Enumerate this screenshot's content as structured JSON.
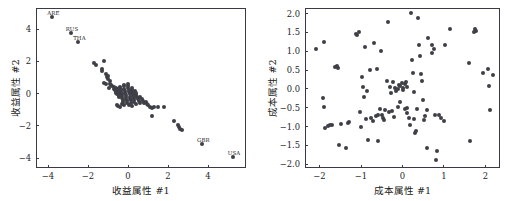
{
  "figure": {
    "background_color": "#ffffff",
    "marker_color": "#3f3f47",
    "axis_color": "#3a3a46",
    "panel_count": 2
  },
  "chart_data": [
    {
      "type": "scatter",
      "title": "",
      "xlabel": "收益属性 #1",
      "ylabel": "收益属性 #2",
      "xlim": [
        -4.6,
        5.9
      ],
      "ylim": [
        -4.6,
        5.3
      ],
      "xticks": [
        -4,
        -2,
        0,
        2,
        4
      ],
      "xticklabels": [
        "−4",
        "−2",
        "0",
        "2",
        "4"
      ],
      "yticks": [
        -4,
        -2,
        0,
        2,
        4
      ],
      "yticklabels": [
        "−4",
        "−2",
        "0",
        "2",
        "4"
      ],
      "grid": false,
      "legend": null,
      "marker_color": "#3f3f47",
      "annotations": [
        {
          "text": "ARE",
          "x": -3.78,
          "y": 4.72
        },
        {
          "text": "RUS",
          "x": -2.85,
          "y": 3.78
        },
        {
          "text": "THA",
          "x": -2.48,
          "y": 3.22
        },
        {
          "text": "GBR",
          "x": 3.72,
          "y": -3.14
        },
        {
          "text": "USA",
          "x": 5.25,
          "y": -3.92
        }
      ],
      "points": [
        [
          -3.78,
          4.72
        ],
        [
          -2.85,
          3.78
        ],
        [
          -2.48,
          3.22
        ],
        [
          -1.72,
          1.88
        ],
        [
          -1.62,
          1.8
        ],
        [
          -1.3,
          1.55
        ],
        [
          -1.28,
          1.38
        ],
        [
          -1.22,
          2.02
        ],
        [
          -1.1,
          1.22
        ],
        [
          -1.05,
          1.05
        ],
        [
          -1.0,
          0.92
        ],
        [
          -0.98,
          1.1
        ],
        [
          -0.92,
          0.78
        ],
        [
          -0.88,
          0.62
        ],
        [
          -0.85,
          0.55
        ],
        [
          -0.78,
          0.48
        ],
        [
          -0.72,
          0.42
        ],
        [
          -0.68,
          0.3
        ],
        [
          -0.65,
          0.22
        ],
        [
          -0.62,
          0.12
        ],
        [
          -0.6,
          0.38
        ],
        [
          -0.58,
          0.05
        ],
        [
          -0.55,
          -0.05
        ],
        [
          -0.52,
          0.18
        ],
        [
          -0.5,
          0.28
        ],
        [
          -0.48,
          0.08
        ],
        [
          -0.46,
          -0.12
        ],
        [
          -0.44,
          -0.22
        ],
        [
          -0.42,
          0.0
        ],
        [
          -0.4,
          0.42
        ],
        [
          -0.38,
          0.35
        ],
        [
          -0.36,
          0.2
        ],
        [
          -0.34,
          0.1
        ],
        [
          -0.32,
          -0.02
        ],
        [
          -0.3,
          -0.15
        ],
        [
          -0.28,
          -0.28
        ],
        [
          -0.26,
          -0.4
        ],
        [
          -0.24,
          -0.5
        ],
        [
          -0.22,
          0.52
        ],
        [
          -0.2,
          0.45
        ],
        [
          -0.18,
          0.3
        ],
        [
          -0.16,
          0.18
        ],
        [
          -0.14,
          0.05
        ],
        [
          -0.12,
          -0.08
        ],
        [
          -0.1,
          -0.2
        ],
        [
          -0.08,
          -0.32
        ],
        [
          -0.06,
          -0.45
        ],
        [
          -0.04,
          -0.58
        ],
        [
          -0.02,
          0.6
        ],
        [
          0.0,
          0.48
        ],
        [
          0.02,
          0.32
        ],
        [
          0.04,
          0.2
        ],
        [
          0.06,
          0.08
        ],
        [
          0.08,
          -0.05
        ],
        [
          0.1,
          -0.18
        ],
        [
          0.12,
          -0.3
        ],
        [
          0.14,
          -0.42
        ],
        [
          0.16,
          -0.55
        ],
        [
          0.18,
          0.38
        ],
        [
          0.2,
          0.25
        ],
        [
          0.22,
          0.12
        ],
        [
          0.24,
          -0.02
        ],
        [
          0.26,
          -0.14
        ],
        [
          0.28,
          -0.26
        ],
        [
          0.3,
          -0.38
        ],
        [
          0.32,
          -0.5
        ],
        [
          0.34,
          0.18
        ],
        [
          0.38,
          0.05
        ],
        [
          0.42,
          -0.08
        ],
        [
          0.46,
          -0.2
        ],
        [
          0.5,
          -0.32
        ],
        [
          0.54,
          -0.44
        ],
        [
          0.58,
          -0.56
        ],
        [
          0.62,
          -0.2
        ],
        [
          0.68,
          -0.34
        ],
        [
          0.74,
          -0.48
        ],
        [
          0.8,
          -0.6
        ],
        [
          0.88,
          -0.52
        ],
        [
          0.96,
          -0.66
        ],
        [
          1.02,
          -0.72
        ],
        [
          1.1,
          -0.85
        ],
        [
          1.18,
          -0.88
        ],
        [
          1.22,
          -1.38
        ],
        [
          1.3,
          -0.82
        ],
        [
          1.48,
          -0.8
        ],
        [
          1.8,
          -0.82
        ],
        [
          2.32,
          -1.72
        ],
        [
          2.48,
          -1.95
        ],
        [
          2.55,
          -2.05
        ],
        [
          2.62,
          -2.18
        ],
        [
          2.7,
          -2.22
        ],
        [
          -0.55,
          -0.68
        ],
        [
          -0.48,
          -0.75
        ],
        [
          -0.42,
          -0.82
        ],
        [
          -0.3,
          -0.62
        ],
        [
          -0.22,
          -0.7
        ],
        [
          0.05,
          -0.72
        ],
        [
          0.18,
          -0.78
        ],
        [
          0.4,
          -0.65
        ],
        [
          -1.18,
          0.68
        ],
        [
          -1.12,
          0.6
        ],
        [
          -0.95,
          0.38
        ],
        [
          3.72,
          -3.14
        ],
        [
          5.25,
          -3.92
        ]
      ]
    },
    {
      "type": "scatter",
      "title": "",
      "xlabel": "成本属性 #1",
      "ylabel": "成本属性 #2",
      "xlim": [
        -2.35,
        2.35
      ],
      "ylim": [
        -2.1,
        2.15
      ],
      "xticks": [
        -2,
        -1,
        0,
        1,
        2
      ],
      "xticklabels": [
        "−2",
        "−1",
        "0",
        "1",
        "2"
      ],
      "yticks": [
        -2.0,
        -1.5,
        -1.0,
        -0.5,
        0.0,
        0.5,
        1.0,
        1.5,
        2.0
      ],
      "yticklabels": [
        "−2.0",
        "−1.5",
        "−1.0",
        "−0.5",
        "0.0",
        "0.5",
        "1.0",
        "1.5",
        "2.0"
      ],
      "grid": false,
      "legend": null,
      "marker_color": "#3f3f47",
      "annotations": [],
      "points": [
        [
          -2.08,
          1.05
        ],
        [
          -1.9,
          1.25
        ],
        [
          -1.92,
          -0.25
        ],
        [
          -1.9,
          -0.48
        ],
        [
          -1.88,
          -1.05
        ],
        [
          -1.8,
          -0.98
        ],
        [
          -1.74,
          -0.95
        ],
        [
          -1.7,
          -0.95
        ],
        [
          -1.62,
          0.58
        ],
        [
          -1.58,
          0.62
        ],
        [
          -1.55,
          0.55
        ],
        [
          -1.52,
          -1.5
        ],
        [
          -1.48,
          -0.92
        ],
        [
          -1.35,
          -1.58
        ],
        [
          -1.32,
          -0.9
        ],
        [
          -1.28,
          -0.88
        ],
        [
          -1.12,
          1.45
        ],
        [
          -1.1,
          1.42
        ],
        [
          -1.05,
          1.5
        ],
        [
          -1.02,
          -0.6
        ],
        [
          -1.0,
          -1.02
        ],
        [
          -0.98,
          0.32
        ],
        [
          -0.95,
          0.05
        ],
        [
          -0.92,
          -0.22
        ],
        [
          -0.9,
          1.12
        ],
        [
          -0.88,
          -0.8
        ],
        [
          -0.85,
          -0.05
        ],
        [
          -0.82,
          -1.35
        ],
        [
          -0.78,
          0.5
        ],
        [
          -0.75,
          -0.78
        ],
        [
          -0.72,
          -0.85
        ],
        [
          -0.68,
          1.22
        ],
        [
          -0.65,
          -0.72
        ],
        [
          -0.62,
          0.52
        ],
        [
          -0.6,
          -1.38
        ],
        [
          -0.58,
          -0.7
        ],
        [
          -0.55,
          -0.52
        ],
        [
          -0.52,
          1.0
        ],
        [
          -0.5,
          -0.68
        ],
        [
          -0.48,
          -0.78
        ],
        [
          -0.45,
          -0.82
        ],
        [
          -0.42,
          -0.55
        ],
        [
          -0.38,
          0.22
        ],
        [
          -0.35,
          1.78
        ],
        [
          -0.32,
          -0.62
        ],
        [
          -0.3,
          0.05
        ],
        [
          -0.28,
          -0.12
        ],
        [
          -0.25,
          -0.58
        ],
        [
          -0.22,
          0.18
        ],
        [
          -0.2,
          -0.75
        ],
        [
          -0.18,
          0.02
        ],
        [
          -0.15,
          -0.05
        ],
        [
          -0.12,
          0.0
        ],
        [
          -0.1,
          -0.48
        ],
        [
          -0.08,
          0.1
        ],
        [
          -0.05,
          0.08
        ],
        [
          -0.02,
          0.15
        ],
        [
          0.0,
          0.02
        ],
        [
          0.02,
          -0.02
        ],
        [
          0.05,
          0.12
        ],
        [
          0.08,
          0.18
        ],
        [
          0.1,
          0.05
        ],
        [
          0.12,
          -0.5
        ],
        [
          0.15,
          -0.78
        ],
        [
          0.18,
          -0.95
        ],
        [
          0.2,
          2.02
        ],
        [
          0.22,
          0.78
        ],
        [
          0.25,
          0.42
        ],
        [
          0.28,
          -0.08
        ],
        [
          0.3,
          -1.18
        ],
        [
          0.32,
          -1.12
        ],
        [
          0.35,
          -0.52
        ],
        [
          0.38,
          1.88
        ],
        [
          0.4,
          1.18
        ],
        [
          0.42,
          0.88
        ],
        [
          0.45,
          0.4
        ],
        [
          0.48,
          0.22
        ],
        [
          0.5,
          -0.3
        ],
        [
          0.52,
          -0.82
        ],
        [
          0.55,
          -0.72
        ],
        [
          0.58,
          -0.55
        ],
        [
          0.6,
          -1.58
        ],
        [
          0.62,
          1.35
        ],
        [
          0.7,
          0.95
        ],
        [
          0.72,
          1.18
        ],
        [
          0.75,
          1.05
        ],
        [
          0.78,
          -0.7
        ],
        [
          0.8,
          -1.88
        ],
        [
          0.82,
          -1.65
        ],
        [
          0.88,
          -0.68
        ],
        [
          0.92,
          -0.78
        ],
        [
          1.0,
          -0.85
        ],
        [
          1.02,
          1.18
        ],
        [
          1.15,
          1.58
        ],
        [
          1.6,
          0.68
        ],
        [
          1.62,
          -1.38
        ],
        [
          1.72,
          1.52
        ],
        [
          1.75,
          1.58
        ],
        [
          1.78,
          1.55
        ],
        [
          1.95,
          0.42
        ],
        [
          2.05,
          0.52
        ],
        [
          2.08,
          0.08
        ],
        [
          2.1,
          -0.55
        ],
        [
          2.18,
          0.38
        ],
        [
          -0.05,
          -0.35
        ],
        [
          0.12,
          -0.65
        ],
        [
          0.28,
          -0.8
        ],
        [
          0.05,
          -0.52
        ]
      ]
    }
  ]
}
